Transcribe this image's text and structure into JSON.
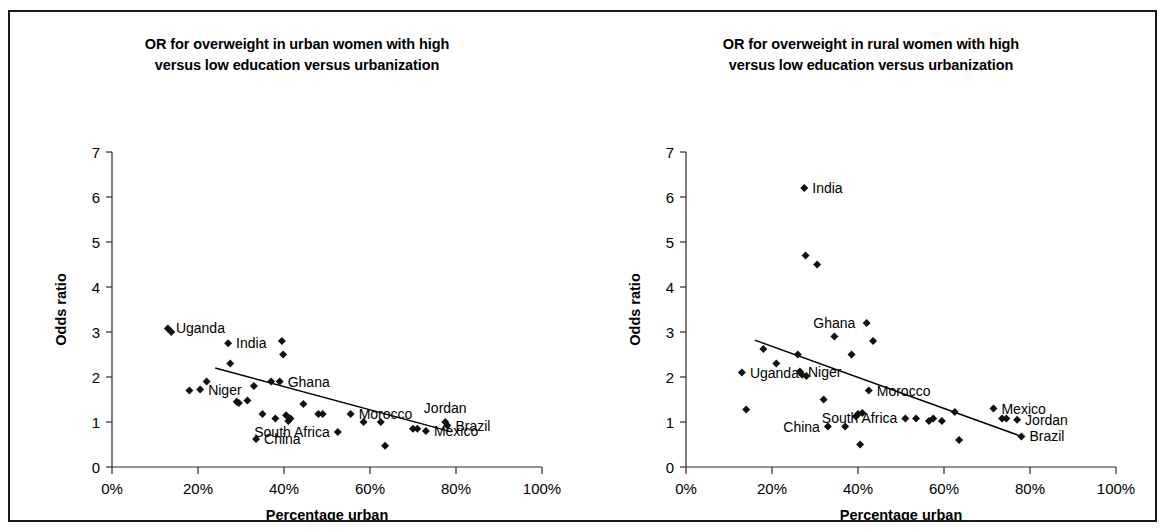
{
  "figure": {
    "border_color": "#1a1a1a",
    "background": "#ffffff",
    "marker_color": "#111111",
    "axis_color": "#2b2b2b"
  },
  "chart_data": [
    {
      "type": "scatter",
      "panel_id": "urban",
      "title": "OR for overweight in urban women with high versus low education versus urbanization",
      "title_lines": [
        "OR for overweight in urban women with high",
        "versus low education versus urbanization"
      ],
      "xlabel": "Percentage urban",
      "ylabel": "Odds ratio",
      "xlim": [
        0,
        100
      ],
      "ylim": [
        0,
        7
      ],
      "xticks": [
        0,
        20,
        40,
        60,
        80,
        100
      ],
      "xtick_labels": [
        "0%",
        "20%",
        "40%",
        "60%",
        "80%",
        "100%"
      ],
      "yticks": [
        0,
        1,
        2,
        3,
        4,
        5,
        6,
        7
      ],
      "ytick_labels": [
        "0",
        "1",
        "2",
        "3",
        "4",
        "5",
        "6",
        "7"
      ],
      "grid": false,
      "legend": "none",
      "trendline": {
        "x1": 24,
        "y1": 2.2,
        "x2": 79,
        "y2": 0.78
      },
      "points": [
        {
          "x": 13,
          "y": 3.08,
          "label": "Uganda",
          "label_pos": "right"
        },
        {
          "x": 13.8,
          "y": 3.0,
          "label": "",
          "label_pos": "right"
        },
        {
          "x": 18,
          "y": 1.7,
          "label": "",
          "label_pos": "right"
        },
        {
          "x": 20.5,
          "y": 1.72,
          "label": "Niger",
          "label_pos": "right"
        },
        {
          "x": 22,
          "y": 1.9,
          "label": "",
          "label_pos": "right"
        },
        {
          "x": 27,
          "y": 2.75,
          "label": "India",
          "label_pos": "right"
        },
        {
          "x": 27.5,
          "y": 2.3,
          "label": "",
          "label_pos": "right"
        },
        {
          "x": 29,
          "y": 1.45,
          "label": "",
          "label_pos": "right"
        },
        {
          "x": 29.5,
          "y": 1.42,
          "label": "",
          "label_pos": "right"
        },
        {
          "x": 31.5,
          "y": 1.48,
          "label": "",
          "label_pos": "right"
        },
        {
          "x": 33,
          "y": 1.8,
          "label": "",
          "label_pos": "right"
        },
        {
          "x": 33.5,
          "y": 0.62,
          "label": "China",
          "label_pos": "right"
        },
        {
          "x": 35,
          "y": 1.18,
          "label": "",
          "label_pos": "right"
        },
        {
          "x": 37,
          "y": 1.9,
          "label": "",
          "label_pos": "right"
        },
        {
          "x": 38,
          "y": 1.08,
          "label": "",
          "label_pos": "right"
        },
        {
          "x": 39,
          "y": 1.9,
          "label": "Ghana",
          "label_pos": "right"
        },
        {
          "x": 39.5,
          "y": 2.8,
          "label": "",
          "label_pos": "right"
        },
        {
          "x": 39.8,
          "y": 2.5,
          "label": "",
          "label_pos": "right"
        },
        {
          "x": 40.5,
          "y": 1.15,
          "label": "",
          "label_pos": "right"
        },
        {
          "x": 41,
          "y": 1.02,
          "label": "",
          "label_pos": "right"
        },
        {
          "x": 41.5,
          "y": 1.08,
          "label": "",
          "label_pos": "right"
        },
        {
          "x": 44.5,
          "y": 1.4,
          "label": "",
          "label_pos": "right"
        },
        {
          "x": 48,
          "y": 1.18,
          "label": "",
          "label_pos": "right"
        },
        {
          "x": 49,
          "y": 1.18,
          "label": "",
          "label_pos": "right"
        },
        {
          "x": 52.5,
          "y": 0.78,
          "label": "South Africa",
          "label_pos": "left"
        },
        {
          "x": 55.5,
          "y": 1.18,
          "label": "Morocco",
          "label_pos": "right"
        },
        {
          "x": 58.5,
          "y": 1.0,
          "label": "",
          "label_pos": "right"
        },
        {
          "x": 62.5,
          "y": 1.0,
          "label": "",
          "label_pos": "right"
        },
        {
          "x": 63.5,
          "y": 0.47,
          "label": "",
          "label_pos": "right"
        },
        {
          "x": 70,
          "y": 0.85,
          "label": "",
          "label_pos": "right"
        },
        {
          "x": 71,
          "y": 0.85,
          "label": "",
          "label_pos": "right"
        },
        {
          "x": 73,
          "y": 0.8,
          "label": "Mexico",
          "label_pos": "right"
        },
        {
          "x": 77.5,
          "y": 1.0,
          "label": "Jordan",
          "label_pos": "above"
        },
        {
          "x": 78,
          "y": 0.92,
          "label": "Brazil",
          "label_pos": "right"
        }
      ]
    },
    {
      "type": "scatter",
      "panel_id": "rural",
      "title": "OR for overweight in rural women with high versus low education versus urbanization",
      "title_lines": [
        "OR for overweight in rural women with high",
        "versus low education versus urbanization"
      ],
      "xlabel": "Percentage urban",
      "ylabel": "Odds ratio",
      "xlim": [
        0,
        100
      ],
      "ylim": [
        0,
        7
      ],
      "xticks": [
        0,
        20,
        40,
        60,
        80,
        100
      ],
      "xtick_labels": [
        "0%",
        "20%",
        "40%",
        "60%",
        "80%",
        "100%"
      ],
      "yticks": [
        0,
        1,
        2,
        3,
        4,
        5,
        6,
        7
      ],
      "ytick_labels": [
        "0",
        "1",
        "2",
        "3",
        "4",
        "5",
        "6",
        "7"
      ],
      "grid": false,
      "legend": "none",
      "trendline": {
        "x1": 16,
        "y1": 2.82,
        "x2": 78,
        "y2": 0.68
      },
      "points": [
        {
          "x": 13,
          "y": 2.1,
          "label": "Uganda",
          "label_pos": "right"
        },
        {
          "x": 14,
          "y": 1.28,
          "label": "",
          "label_pos": "right"
        },
        {
          "x": 18,
          "y": 2.62,
          "label": "",
          "label_pos": "right"
        },
        {
          "x": 21,
          "y": 2.3,
          "label": "",
          "label_pos": "right"
        },
        {
          "x": 26,
          "y": 2.5,
          "label": "",
          "label_pos": "right"
        },
        {
          "x": 26.5,
          "y": 2.12,
          "label": "Niger",
          "label_pos": "right"
        },
        {
          "x": 27,
          "y": 2.05,
          "label": "",
          "label_pos": "right"
        },
        {
          "x": 27.5,
          "y": 6.2,
          "label": "India",
          "label_pos": "right"
        },
        {
          "x": 27.8,
          "y": 4.7,
          "label": "",
          "label_pos": "right"
        },
        {
          "x": 28,
          "y": 2.02,
          "label": "",
          "label_pos": "right"
        },
        {
          "x": 30.5,
          "y": 4.5,
          "label": "",
          "label_pos": "right"
        },
        {
          "x": 32,
          "y": 1.5,
          "label": "",
          "label_pos": "right"
        },
        {
          "x": 33,
          "y": 0.9,
          "label": "China",
          "label_pos": "left"
        },
        {
          "x": 34.5,
          "y": 2.9,
          "label": "Ghana",
          "label_pos": "above"
        },
        {
          "x": 37,
          "y": 0.9,
          "label": "",
          "label_pos": "right"
        },
        {
          "x": 38.5,
          "y": 2.5,
          "label": "",
          "label_pos": "right"
        },
        {
          "x": 39.5,
          "y": 1.12,
          "label": "",
          "label_pos": "right"
        },
        {
          "x": 40,
          "y": 1.18,
          "label": "",
          "label_pos": "right"
        },
        {
          "x": 40.5,
          "y": 0.5,
          "label": "",
          "label_pos": "right"
        },
        {
          "x": 41,
          "y": 1.2,
          "label": "",
          "label_pos": "right"
        },
        {
          "x": 42,
          "y": 3.2,
          "label": "",
          "label_pos": "right"
        },
        {
          "x": 42.5,
          "y": 1.7,
          "label": "Morocco",
          "label_pos": "right"
        },
        {
          "x": 43.5,
          "y": 2.8,
          "label": "",
          "label_pos": "right"
        },
        {
          "x": 51,
          "y": 1.08,
          "label": "South Africa",
          "label_pos": "left"
        },
        {
          "x": 53.5,
          "y": 1.08,
          "label": "",
          "label_pos": "right"
        },
        {
          "x": 56.5,
          "y": 1.02,
          "label": "",
          "label_pos": "right"
        },
        {
          "x": 57.5,
          "y": 1.08,
          "label": "",
          "label_pos": "right"
        },
        {
          "x": 59.5,
          "y": 1.02,
          "label": "",
          "label_pos": "right"
        },
        {
          "x": 62.5,
          "y": 1.22,
          "label": "",
          "label_pos": "right"
        },
        {
          "x": 63.5,
          "y": 0.6,
          "label": "",
          "label_pos": "right"
        },
        {
          "x": 71.5,
          "y": 1.3,
          "label": "Mexico",
          "label_pos": "right"
        },
        {
          "x": 73.5,
          "y": 1.08,
          "label": "",
          "label_pos": "right"
        },
        {
          "x": 74.5,
          "y": 1.08,
          "label": "",
          "label_pos": "right"
        },
        {
          "x": 77,
          "y": 1.05,
          "label": "Jordan",
          "label_pos": "right"
        },
        {
          "x": 78,
          "y": 0.68,
          "label": "Brazil",
          "label_pos": "right"
        }
      ]
    }
  ]
}
